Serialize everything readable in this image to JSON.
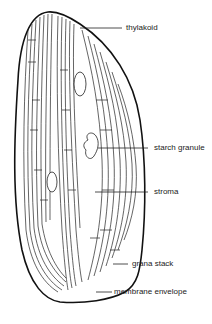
{
  "diagram": {
    "labels": [
      {
        "id": "thylakoid",
        "text": "thylakoid"
      },
      {
        "id": "starch-granule",
        "text": "starch granule"
      },
      {
        "id": "stroma",
        "text": "stroma"
      },
      {
        "id": "grana-stack",
        "text": "grana stack"
      },
      {
        "id": "membrane-envelope",
        "text": "membrane envelope"
      }
    ],
    "caption": "",
    "colors": {
      "line": "#111111",
      "background": "#ffffff"
    }
  }
}
